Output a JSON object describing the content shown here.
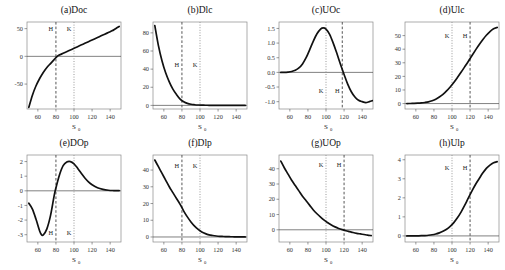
{
  "figure": {
    "xlabel": "S",
    "xlabel_sub": "0",
    "marker_H": "H",
    "marker_K": "K",
    "colors": {
      "curve": "#111111",
      "frame": "#8a8a8a",
      "H": "#555555",
      "K": "#999999"
    }
  },
  "chart_data": [
    {
      "type": "line",
      "title": "(a)Doc",
      "xlabel": "S0",
      "ylabel": "",
      "xlim": [
        48,
        152
      ],
      "ylim": [
        -95,
        62
      ],
      "grid": false,
      "xticks": [
        60,
        80,
        100,
        120,
        140
      ],
      "yticks": [
        50,
        0,
        -50
      ],
      "ytick_labels": [
        "50",
        "0",
        "-50"
      ],
      "markers": [
        {
          "label": "H",
          "x": 80,
          "style": "dashed"
        },
        {
          "label": "K",
          "x": 100,
          "style": "dotted"
        }
      ],
      "marker_label_y": 46,
      "zero_line": true,
      "x": [
        50,
        54,
        58,
        62,
        66,
        70,
        74,
        78,
        82,
        86,
        90,
        94,
        98,
        102,
        106,
        110,
        114,
        118,
        122,
        126,
        130,
        134,
        138,
        142,
        146,
        150
      ],
      "y": [
        -92,
        -70,
        -53,
        -40,
        -29,
        -20,
        -13,
        -6,
        1,
        4,
        7,
        10,
        13,
        16,
        19,
        22,
        25,
        28,
        31,
        34,
        37,
        40,
        43,
        46,
        50,
        54
      ]
    },
    {
      "type": "line",
      "title": "(b)Dlc",
      "xlabel": "S0",
      "ylabel": "",
      "xlim": [
        48,
        152
      ],
      "ylim": [
        -4,
        92
      ],
      "grid": false,
      "xticks": [
        60,
        80,
        100,
        120,
        140
      ],
      "yticks": [
        80,
        60,
        40,
        20,
        0
      ],
      "ytick_labels": [
        "80",
        "60",
        "40",
        "20",
        "0"
      ],
      "markers": [
        {
          "label": "H",
          "x": 80,
          "style": "dashed"
        },
        {
          "label": "K",
          "x": 100,
          "style": "dotted"
        }
      ],
      "marker_label_y": 42,
      "zero_line": true,
      "x": [
        50,
        54,
        58,
        62,
        66,
        70,
        74,
        78,
        82,
        86,
        90,
        94,
        98,
        102,
        106,
        110,
        114,
        118,
        122,
        126,
        130,
        134,
        138,
        142,
        146,
        150
      ],
      "y": [
        88,
        66,
        49,
        36,
        26,
        18,
        12,
        7,
        4,
        2.2,
        1.2,
        0.7,
        0.4,
        0.25,
        0.15,
        0.1,
        0.07,
        0.05,
        0.04,
        0.03,
        0.02,
        0.02,
        0.01,
        0.01,
        0.01,
        0.0
      ]
    },
    {
      "type": "line",
      "title": "(c)UOc",
      "xlabel": "S0",
      "ylabel": "",
      "xlim": [
        48,
        152
      ],
      "ylim": [
        -1.25,
        1.72
      ],
      "grid": false,
      "xticks": [
        60,
        80,
        100,
        120,
        140
      ],
      "yticks": [
        1.5,
        1.0,
        0.5,
        0.0,
        -0.5,
        -1.0
      ],
      "ytick_labels": [
        "1.5",
        "1.0",
        "0.5",
        "0.0",
        "-0.5",
        "-1.0"
      ],
      "markers": [
        {
          "label": "K",
          "x": 100,
          "style": "dotted"
        },
        {
          "label": "H",
          "x": 118,
          "style": "dashed"
        }
      ],
      "marker_label_y": -0.72,
      "zero_line": true,
      "x": [
        50,
        54,
        58,
        62,
        66,
        70,
        74,
        78,
        82,
        86,
        90,
        94,
        97,
        100,
        104,
        108,
        112,
        116,
        120,
        124,
        128,
        132,
        136,
        140,
        144,
        148,
        152
      ],
      "y": [
        0.0,
        0.0,
        0.01,
        0.03,
        0.07,
        0.15,
        0.29,
        0.5,
        0.78,
        1.07,
        1.32,
        1.48,
        1.52,
        1.48,
        1.3,
        1.0,
        0.65,
        0.28,
        -0.07,
        -0.4,
        -0.66,
        -0.84,
        -0.95,
        -1.0,
        -1.03,
        -1.0,
        -0.96
      ]
    },
    {
      "type": "line",
      "title": "(d)Ulc",
      "xlabel": "S0",
      "ylabel": "",
      "xlim": [
        48,
        152
      ],
      "ylim": [
        -4,
        60
      ],
      "grid": false,
      "xticks": [
        60,
        80,
        100,
        120,
        140
      ],
      "yticks": [
        50,
        40,
        30,
        20,
        10,
        0
      ],
      "ytick_labels": [
        "50",
        "40",
        "30",
        "20",
        "10",
        "0"
      ],
      "markers": [
        {
          "label": "K",
          "x": 100,
          "style": "dotted"
        },
        {
          "label": "H",
          "x": 120,
          "style": "dashed"
        }
      ],
      "marker_label_y": 48,
      "zero_line": true,
      "x": [
        50,
        54,
        58,
        62,
        66,
        70,
        74,
        78,
        82,
        86,
        90,
        94,
        98,
        102,
        106,
        110,
        114,
        118,
        122,
        126,
        130,
        134,
        138,
        142,
        146,
        150
      ],
      "y": [
        0.0,
        0.05,
        0.12,
        0.25,
        0.45,
        0.8,
        1.3,
        2.1,
        3.2,
        4.8,
        6.8,
        9.3,
        12.2,
        15.5,
        19.2,
        23.0,
        27.0,
        31.0,
        35.2,
        39.3,
        43.3,
        47.0,
        50.3,
        53.0,
        55.0,
        56.0
      ]
    },
    {
      "type": "line",
      "title": "(e)DOp",
      "xlabel": "S0",
      "ylabel": "",
      "xlim": [
        48,
        152
      ],
      "ylim": [
        -3.5,
        2.45
      ],
      "grid": false,
      "xticks": [
        60,
        80,
        100,
        120,
        140
      ],
      "yticks": [
        2,
        1,
        0,
        -1,
        -2,
        -3
      ],
      "ytick_labels": [
        "2",
        "1",
        "0",
        "-1",
        "-2",
        "-3"
      ],
      "markers": [
        {
          "label": "H",
          "x": 80,
          "style": "dashed"
        },
        {
          "label": "K",
          "x": 100,
          "style": "dotted"
        }
      ],
      "marker_label_y": -3.05,
      "zero_line": true,
      "x": [
        50,
        54,
        58,
        62,
        64,
        66,
        70,
        74,
        78,
        80,
        84,
        88,
        92,
        96,
        100,
        104,
        108,
        112,
        116,
        120,
        126,
        132,
        138,
        144,
        150
      ],
      "y": [
        -0.85,
        -1.25,
        -1.95,
        -2.75,
        -3.0,
        -3.02,
        -2.6,
        -1.7,
        -0.35,
        0.2,
        1.1,
        1.72,
        1.97,
        2.0,
        1.85,
        1.55,
        1.2,
        0.88,
        0.62,
        0.42,
        0.21,
        0.1,
        0.04,
        0.02,
        0.01
      ]
    },
    {
      "type": "line",
      "title": "(f)Dlp",
      "xlabel": "S0",
      "ylabel": "",
      "xlim": [
        48,
        152
      ],
      "ylim": [
        -3,
        49
      ],
      "grid": false,
      "xticks": [
        60,
        80,
        100,
        120,
        140
      ],
      "yticks": [
        40,
        30,
        20,
        10,
        0
      ],
      "ytick_labels": [
        "40",
        "30",
        "20",
        "10",
        "0"
      ],
      "markers": [
        {
          "label": "H",
          "x": 80,
          "style": "dashed"
        },
        {
          "label": "K",
          "x": 100,
          "style": "dotted"
        }
      ],
      "marker_label_y": 41,
      "zero_line": true,
      "x": [
        50,
        54,
        58,
        62,
        66,
        70,
        74,
        78,
        82,
        86,
        90,
        94,
        98,
        102,
        106,
        110,
        114,
        118,
        122,
        126,
        130,
        134,
        138,
        142,
        146,
        150
      ],
      "y": [
        46,
        42,
        38,
        34,
        30,
        26.5,
        23,
        19.5,
        15.5,
        12,
        9,
        6.5,
        4.5,
        3,
        2,
        1.3,
        0.9,
        0.6,
        0.4,
        0.3,
        0.2,
        0.15,
        0.1,
        0.08,
        0.05,
        0.03
      ]
    },
    {
      "type": "line",
      "title": "(g)UOp",
      "xlabel": "S0",
      "ylabel": "",
      "xlim": [
        48,
        152
      ],
      "ylim": [
        -8,
        49
      ],
      "grid": false,
      "xticks": [
        60,
        80,
        100,
        120,
        140
      ],
      "yticks": [
        40,
        30,
        20,
        10,
        0
      ],
      "ytick_labels": [
        "40",
        "30",
        "20",
        "10",
        "0"
      ],
      "markers": [
        {
          "label": "K",
          "x": 100,
          "style": "dotted"
        },
        {
          "label": "H",
          "x": 120,
          "style": "dashed"
        }
      ],
      "marker_label_y": 41,
      "zero_line": true,
      "x": [
        50,
        54,
        58,
        62,
        66,
        70,
        74,
        78,
        82,
        86,
        90,
        94,
        98,
        102,
        106,
        110,
        114,
        118,
        122,
        126,
        130,
        134,
        138,
        142,
        146,
        150
      ],
      "y": [
        45,
        40.5,
        36.5,
        32.5,
        29,
        25.5,
        22,
        19,
        16,
        13,
        10.5,
        8.3,
        6.3,
        4.6,
        3.1,
        1.9,
        0.9,
        0.1,
        -0.6,
        -1.2,
        -1.8,
        -2.3,
        -2.7,
        -3.1,
        -3.5,
        -3.8
      ]
    },
    {
      "type": "line",
      "title": "(h)Ulp",
      "xlabel": "S0",
      "ylabel": "",
      "xlim": [
        48,
        152
      ],
      "ylim": [
        -0.32,
        4.25
      ],
      "grid": false,
      "xticks": [
        60,
        80,
        100,
        120,
        140
      ],
      "yticks": [
        4,
        3,
        2,
        1,
        0
      ],
      "ytick_labels": [
        "4",
        "3",
        "2",
        "1",
        "0"
      ],
      "markers": [
        {
          "label": "K",
          "x": 100,
          "style": "dotted"
        },
        {
          "label": "H",
          "x": 120,
          "style": "dashed"
        }
      ],
      "marker_label_y": 3.45,
      "zero_line": true,
      "x": [
        50,
        54,
        58,
        62,
        66,
        70,
        74,
        78,
        82,
        86,
        90,
        94,
        98,
        102,
        106,
        110,
        114,
        118,
        122,
        126,
        130,
        134,
        138,
        142,
        146,
        150
      ],
      "y": [
        0.0,
        0.0,
        0.0,
        0.005,
        0.01,
        0.02,
        0.035,
        0.06,
        0.1,
        0.16,
        0.24,
        0.35,
        0.5,
        0.7,
        0.95,
        1.25,
        1.6,
        1.98,
        2.35,
        2.7,
        3.0,
        3.3,
        3.55,
        3.72,
        3.84,
        3.9
      ]
    }
  ]
}
